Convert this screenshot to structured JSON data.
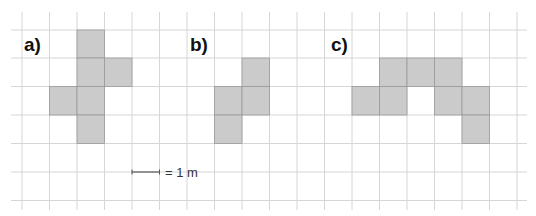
{
  "figure": {
    "grid": {
      "origin_x": 22,
      "origin_y": 30,
      "cell": 27.4,
      "cols_x": [
        22,
        49.5,
        77,
        104.5,
        132,
        159.5,
        187,
        214.5,
        242,
        269.5,
        297,
        324.5,
        352,
        379.5,
        407,
        434.5,
        462,
        489.5,
        517
      ],
      "rows_y": [
        30,
        58,
        86.5,
        115,
        143.5,
        172,
        200.5
      ],
      "extent": {
        "x_min": 11,
        "x_max": 527,
        "y_min": 12,
        "y_max": 210
      },
      "line_color": "#d6d6d6"
    },
    "shape_fill": "#cbcbcb",
    "shape_stroke": "#9a9a9a",
    "shapes": [
      {
        "label": "a)",
        "label_pos": {
          "x": 24,
          "y": 35
        },
        "cells": [
          [
            2,
            0
          ],
          [
            2,
            1
          ],
          [
            3,
            1
          ],
          [
            1,
            2
          ],
          [
            2,
            2
          ],
          [
            2,
            3
          ]
        ]
      },
      {
        "label": "b)",
        "label_pos": {
          "x": 190,
          "y": 35
        },
        "cells": [
          [
            8,
            1
          ],
          [
            7,
            2
          ],
          [
            8,
            2
          ],
          [
            7,
            3
          ]
        ]
      },
      {
        "label": "c)",
        "label_pos": {
          "x": 331,
          "y": 35
        },
        "cells": [
          [
            13,
            1
          ],
          [
            14,
            1
          ],
          [
            15,
            1
          ],
          [
            12,
            2
          ],
          [
            13,
            2
          ],
          [
            15,
            2
          ],
          [
            16,
            2
          ],
          [
            16,
            3
          ]
        ]
      }
    ],
    "scale": {
      "text": "= 1 m",
      "line_x1": 132,
      "line_x2": 159.5,
      "line_y": 172,
      "text_x": 165,
      "text_y": 166
    }
  }
}
